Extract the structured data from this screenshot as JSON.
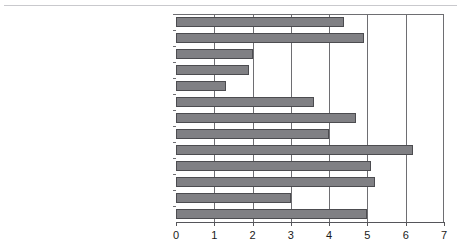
{
  "chart_data": {
    "type": "bar",
    "orientation": "horizontal",
    "title": "",
    "xlabel": "",
    "ylabel": "",
    "xlim": [
      0,
      7
    ],
    "xticks": [
      "0",
      "1",
      "2",
      "3",
      "4",
      "5",
      "6",
      "7"
    ],
    "grid": true,
    "legend": false,
    "bar_color": "#808084",
    "bar_edge_color": "#4c4c50",
    "axis_color": "#6e6e72",
    "categories": [
      "Leisure and hospitality",
      "Education and health services",
      "Professional and business services",
      "Information",
      "Finance and insurance",
      "Utilities",
      "Retail trade",
      "Wholesale trade",
      "Transportation and warehousing",
      "Manufacturing",
      "Construction",
      "Mining",
      "Agriculture, forestry and fishing"
    ],
    "values": [
      4.4,
      4.9,
      2.0,
      1.9,
      1.3,
      3.6,
      4.7,
      4.0,
      6.2,
      5.1,
      5.2,
      3.0,
      5.0
    ]
  }
}
